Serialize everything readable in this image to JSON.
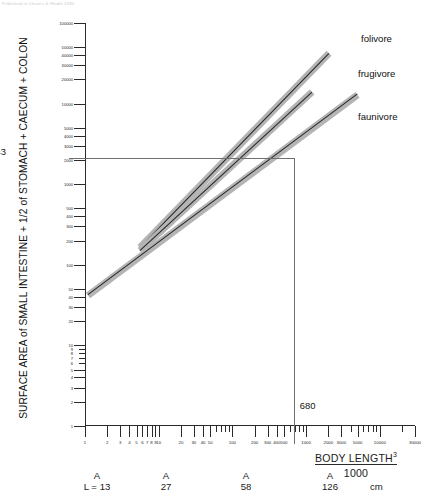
{
  "header_note": "Published in Chivers & Hladik 1980",
  "axes": {
    "y_title": "SURFACE AREA of SMALL INTESTINE + 1/2 of STOMACH + CAECUM + COLON",
    "x_title_numerator": "BODY LENGTH",
    "x_title_exponent": "3",
    "x_title_denominator": "1000",
    "x_unit": "cm"
  },
  "reference": {
    "y_value": "2143",
    "x_value": "680"
  },
  "legend": {
    "items": [
      {
        "label": "folivore",
        "color": "#242424"
      },
      {
        "label": "frugivore",
        "color": "#242424"
      },
      {
        "label": "faunivore",
        "color": "#242424"
      }
    ]
  },
  "length_scale": {
    "prefix": "L =",
    "marker": "A",
    "values": [
      "13",
      "27",
      "58",
      "126"
    ],
    "unit": "cm"
  },
  "chart_data": {
    "type": "line",
    "title": "",
    "xlabel": "BODY LENGTH^3 / 1000 (cm)",
    "ylabel": "SURFACE AREA of SMALL INTESTINE + 1/2 of STOMACH + CAECUM + COLON",
    "xscale": "log",
    "yscale": "log",
    "xlim": [
      1,
      30000
    ],
    "ylim": [
      1,
      100000
    ],
    "grid": false,
    "legend_position": "right",
    "x_ticks": [
      1,
      2,
      3,
      4,
      5,
      6,
      7,
      8,
      9,
      10,
      20,
      30,
      40,
      50,
      100,
      200,
      300,
      400,
      500,
      1000,
      2000,
      3000,
      5000,
      10000,
      30000
    ],
    "x_tick_labels": [
      "1",
      "2",
      "3",
      "4",
      "5",
      "6",
      "7",
      "8",
      "9",
      "10",
      "20",
      "30",
      "40",
      "50",
      "100",
      "200",
      "300",
      "400",
      "500",
      "1000",
      "2000",
      "3000",
      "5000",
      "10000",
      "30000"
    ],
    "y_ticks": [
      1,
      2,
      3,
      4,
      5,
      6,
      7,
      8,
      9,
      10,
      20,
      30,
      40,
      50,
      100,
      200,
      300,
      400,
      500,
      1000,
      2000,
      3000,
      4000,
      5000,
      10000,
      20000,
      30000,
      40000,
      50000,
      100000
    ],
    "y_tick_labels": [
      "1",
      "2",
      "3",
      "4",
      "5",
      "6",
      "7",
      "8",
      "9",
      "10",
      "20",
      "30",
      "40",
      "50",
      "100",
      "200",
      "300",
      "400",
      "500",
      "1000",
      "2000",
      "3000",
      "4000",
      "5000",
      "10000",
      "20000",
      "30000",
      "40000",
      "50000",
      "100000"
    ],
    "annotations": [
      {
        "text": "2143",
        "axis": "y",
        "value": 2143
      },
      {
        "text": "680",
        "axis": "x",
        "value": 680
      }
    ],
    "series": [
      {
        "name": "folivore",
        "x": [
          5.5,
          2000
        ],
        "y": [
          165,
          42000
        ],
        "band": true,
        "band_color": "#b4b4b4"
      },
      {
        "name": "frugivore",
        "x": [
          5.5,
          1200
        ],
        "y": [
          150,
          14000
        ],
        "band": true,
        "band_color": "#b4b4b4"
      },
      {
        "name": "faunivore",
        "x": [
          1.1,
          5000
        ],
        "y": [
          42,
          13000
        ],
        "band": true,
        "band_color": "#b4b4b4"
      }
    ]
  }
}
